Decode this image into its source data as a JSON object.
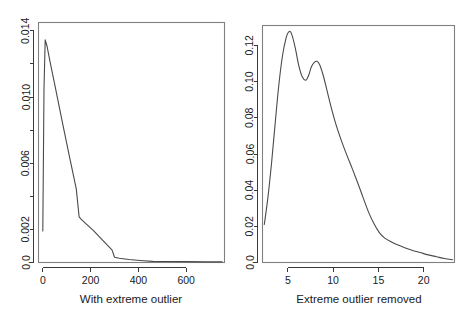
{
  "figure": {
    "background_color": "#ffffff",
    "line_color": "#4a4a4a",
    "axis_color": "#3a3a3a",
    "box_color": "#808080"
  },
  "chart_data": [
    {
      "type": "line",
      "panel": "left",
      "title": "",
      "xlabel": "With extreme outlier",
      "ylabel": "",
      "xlim": [
        -18,
        760
      ],
      "ylim": [
        0,
        0.0145
      ],
      "grid": false,
      "legend": "none",
      "xticks": [
        0,
        200,
        400,
        600
      ],
      "xticklabels": [
        "0",
        "200",
        "400",
        "600"
      ],
      "yticks": [
        0.0,
        0.002,
        0.006,
        0.01,
        0.014
      ],
      "yticklabels": [
        "0.0",
        "0.002",
        "0.006",
        "0.010",
        "0.014"
      ],
      "yminorticks": [
        0.004,
        0.008,
        0.012
      ],
      "x": [
        0,
        5,
        10,
        18,
        30,
        50,
        80,
        110,
        140,
        152,
        160,
        180,
        210,
        250,
        290,
        300,
        320,
        360,
        420,
        460,
        520,
        600,
        680,
        750
      ],
      "values": [
        0.0019,
        0.0105,
        0.01345,
        0.01305,
        0.01215,
        0.01075,
        0.0086,
        0.0065,
        0.00445,
        0.00275,
        0.00262,
        0.00235,
        0.00195,
        0.00135,
        0.00075,
        0.00032,
        0.00026,
        0.00018,
        0.00011,
        7e-05,
        6e-05,
        5e-05,
        4e-05,
        4e-05
      ]
    },
    {
      "type": "line",
      "panel": "right",
      "title": "",
      "xlabel": "Extreme outlier removed",
      "ylabel": "",
      "xlim": [
        2.2,
        23.4
      ],
      "ylim": [
        0,
        0.131
      ],
      "grid": false,
      "legend": "none",
      "xticks": [
        5,
        10,
        15,
        20
      ],
      "xticklabels": [
        "5",
        "10",
        "15",
        "20"
      ],
      "yticks": [
        0.0,
        0.02,
        0.04,
        0.06,
        0.08,
        0.1,
        0.12
      ],
      "yticklabels": [
        "0.0",
        "0.02",
        "0.04",
        "0.06",
        "0.08",
        "0.10",
        "0.12"
      ],
      "x": [
        2.4,
        2.8,
        3.2,
        3.6,
        4.0,
        4.4,
        4.8,
        5.1,
        5.4,
        5.8,
        6.2,
        6.6,
        7.0,
        7.3,
        7.6,
        7.9,
        8.2,
        8.5,
        8.9,
        9.3,
        9.8,
        10.3,
        10.9,
        11.5,
        12.1,
        12.7,
        13.3,
        13.9,
        14.5,
        15.1,
        15.7,
        16.4,
        17.1,
        17.9,
        18.7,
        19.6,
        20.5,
        21.4,
        22.3,
        23.2
      ],
      "values": [
        0.021,
        0.036,
        0.055,
        0.077,
        0.098,
        0.114,
        0.124,
        0.1275,
        0.1265,
        0.119,
        0.109,
        0.1025,
        0.1008,
        0.1035,
        0.1082,
        0.1105,
        0.1112,
        0.1095,
        0.1035,
        0.0955,
        0.0855,
        0.0765,
        0.0675,
        0.0595,
        0.052,
        0.0442,
        0.036,
        0.028,
        0.0215,
        0.0165,
        0.0135,
        0.0115,
        0.0098,
        0.0082,
        0.0068,
        0.0055,
        0.0042,
        0.0032,
        0.0022,
        0.0015
      ]
    }
  ]
}
